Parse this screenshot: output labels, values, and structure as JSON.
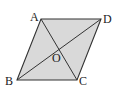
{
  "figure": {
    "shape": "parallelogram",
    "fill_color": "#d9d9d9",
    "stroke_color": "#333333",
    "vertices": {
      "A": {
        "label": "A",
        "x": 41,
        "y": 19
      },
      "B": {
        "label": "B",
        "x": 17,
        "y": 80
      },
      "C": {
        "label": "C",
        "x": 77,
        "y": 80
      },
      "D": {
        "label": "D",
        "x": 101,
        "y": 19
      }
    },
    "center": {
      "label": "O",
      "x": 59,
      "y": 49
    },
    "diagonals": [
      "AC",
      "BD"
    ]
  }
}
